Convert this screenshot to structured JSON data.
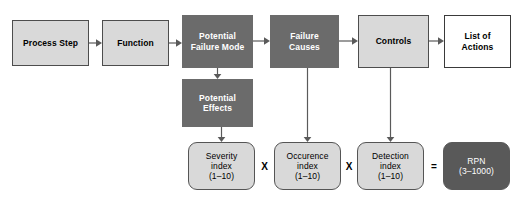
{
  "diagram": {
    "colors": {
      "light_box_fill": "#d9d9d9",
      "dark_box_fill": "#6b6b6b",
      "rpn_fill": "#595959",
      "white_box_fill": "#ffffff",
      "border": "#4d4d4d",
      "connector": "#5a5a5a",
      "background": "#ffffff"
    },
    "nodes": [
      {
        "id": "process-step",
        "label": "Process Step",
        "style": "light",
        "x": 12,
        "y": 20,
        "w": 77,
        "h": 46
      },
      {
        "id": "function",
        "label": "Function",
        "style": "light",
        "x": 102,
        "y": 20,
        "w": 67,
        "h": 46
      },
      {
        "id": "potential-failure-mode",
        "label": "Potential\nFailure Mode",
        "style": "dark",
        "x": 182,
        "y": 15,
        "w": 71,
        "h": 53
      },
      {
        "id": "failure-causes",
        "label": "Failure\nCauses",
        "style": "dark",
        "x": 270,
        "y": 15,
        "w": 69,
        "h": 53
      },
      {
        "id": "controls",
        "label": "Controls",
        "style": "light",
        "x": 358,
        "y": 15,
        "w": 71,
        "h": 53
      },
      {
        "id": "list-of-actions",
        "label": "List of\nActions",
        "style": "white",
        "x": 444,
        "y": 15,
        "w": 67,
        "h": 53
      },
      {
        "id": "potential-effects",
        "label": "Potential\nEffects",
        "style": "dark",
        "x": 182,
        "y": 79,
        "w": 71,
        "h": 48
      }
    ],
    "index_nodes": [
      {
        "id": "severity-index",
        "label": "Severity\nindex\n(1–10)",
        "style": "index",
        "x": 188,
        "y": 142,
        "w": 67,
        "h": 48
      },
      {
        "id": "occurrence-index",
        "label": "Occurence\nindex\n(1–10)",
        "style": "index",
        "x": 274,
        "y": 142,
        "w": 67,
        "h": 48
      },
      {
        "id": "detection-index",
        "label": "Detection\nindex\n(1–10)",
        "style": "index",
        "x": 357,
        "y": 142,
        "w": 67,
        "h": 48
      },
      {
        "id": "rpn",
        "label": "RPN\n(3–1000)",
        "style": "rpn",
        "x": 443,
        "y": 142,
        "w": 67,
        "h": 48
      }
    ],
    "operators": [
      {
        "id": "operator-multiply-1",
        "symbol": "X",
        "x": 255,
        "y": 158
      },
      {
        "id": "operator-multiply-2",
        "symbol": "X",
        "x": 341,
        "y": 158
      },
      {
        "id": "operator-equals",
        "symbol": "=",
        "x": 425,
        "y": 158
      }
    ],
    "connectors": [
      {
        "id": "arrow-process-step-to-function",
        "from": "process-step",
        "to": "function",
        "orientation": "horizontal"
      },
      {
        "id": "arrow-function-to-potential-failure-mode",
        "from": "function",
        "to": "potential-failure-mode",
        "orientation": "horizontal"
      },
      {
        "id": "arrow-potential-failure-mode-to-failure-causes",
        "from": "potential-failure-mode",
        "to": "failure-causes",
        "orientation": "horizontal"
      },
      {
        "id": "arrow-failure-causes-to-controls",
        "from": "failure-causes",
        "to": "controls",
        "orientation": "horizontal"
      },
      {
        "id": "arrow-controls-to-list-of-actions",
        "from": "controls",
        "to": "list-of-actions",
        "orientation": "horizontal"
      },
      {
        "id": "arrow-potential-failure-mode-to-potential-effects",
        "from": "potential-failure-mode",
        "to": "potential-effects",
        "orientation": "vertical"
      },
      {
        "id": "arrow-potential-effects-to-severity-index",
        "from": "potential-effects",
        "to": "severity-index",
        "orientation": "vertical"
      },
      {
        "id": "arrow-failure-causes-to-occurrence-index",
        "from": "failure-causes",
        "to": "occurrence-index",
        "orientation": "vertical"
      },
      {
        "id": "arrow-controls-to-detection-index",
        "from": "controls",
        "to": "detection-index",
        "orientation": "vertical"
      }
    ]
  }
}
